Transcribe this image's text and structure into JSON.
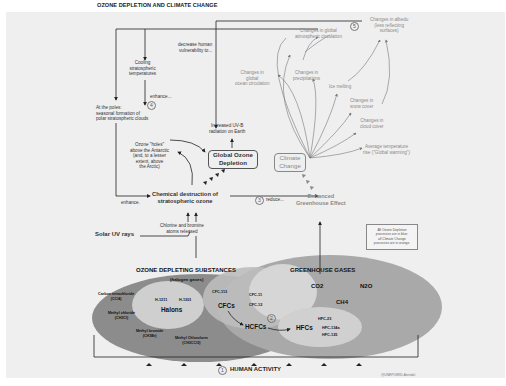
{
  "title": "OZONE DEPLETION AND CLIMATE CHANGE",
  "colors": {
    "panel_bg": "#efefef",
    "ozone_ellipse": "#8c8c8c",
    "greenhouse_ellipse": "#a9a9a9",
    "inner_circle": "#cfcfcf",
    "text_dark": "#333333",
    "text_light": "#8a8a8a"
  },
  "ozone_side": {
    "cooling": "Cooling\nstratospheric\ntemperatures",
    "enhance_4": "enhance...",
    "step_4": "4",
    "polar_clouds": "At the poles:\nseasonal formation of\npolar stratospheric clouds",
    "ozone_holes": "Ozone \"holes\"\nabove the Antarctic\n(and, to a lesser\nextent, above\nthe Arctic)",
    "decrease_vulnerability": "decrease human\nvulnerability to...",
    "uvb": "Increased UV-B\nradiation on Earth",
    "global_ozone_box": "Global Ozone\nDepletion",
    "enhance_left": "enhance.",
    "chemical_destruction": "Chemical destruction of\nstratospheric ozone",
    "chlorine_bromine": "Chlorine and bromine\natoms released",
    "solar_uv": "Solar UV rays"
  },
  "climate_side": {
    "step_5": "5",
    "atmospheric_circulation": "Changes in global\natmospheric circulation",
    "albedo": "Changes in albedu\n(less reflecting\nsurfaces)",
    "ocean_circulation": "Changes in\nglobal\nocean circulation",
    "precipitations": "Changes in\nprecipitations",
    "ice_melting": "Ice melting",
    "snow_cover": "Changes in\nsnow cover",
    "cloud_cover": "Changes in\ncloud cover",
    "avg_temp": "Average temperature\nrise (\"Global warming\")",
    "climate_box": "Climate\nChange",
    "step_3": "3",
    "reduce": "reduce...",
    "greenhouse_effect": "Enhanced\nGreenhouse Effect"
  },
  "legend": {
    "text": "All Ozone Depletion\nprocesses are in blue;\nall Climate Change\nprocesses are in orange."
  },
  "substances": {
    "ods_title": "OZONE DEPLETING SUBSTANCES",
    "ods_subtitle": "(halogen gases)",
    "carbon_tet": "Carbon tetrachloride\n(CCl4)",
    "methyl_chloride": "Methyl chloride\n(CH3Cl)",
    "methyl_bromide": "Methyl bromide\n(CH3Br)",
    "methyl_chloroform": "Methyl Chloroform\n(CH3CCl3)",
    "halons": "Halons",
    "h1211": "H-1211",
    "h1301": "H-1301",
    "cfcs": "CFCs",
    "cfc113": "CFC-113",
    "cfc11": "CFC-11",
    "cfc12": "CFC-12",
    "step_2": "2",
    "hcfcs": "HCFCs",
    "ghg_title": "GREENHOUSE GASES",
    "co2": "CO2",
    "n2o": "N2O",
    "ch4": "CH4",
    "hfcs": "HFCs",
    "hfc23": "HFC-23",
    "hfc134a": "HFC-134a",
    "hfc125": "HFC-125"
  },
  "footer": {
    "step_1": "1",
    "human_activity": "HUMAN ACTIVITY",
    "credit": "@UNEP/GRID-Arendal"
  }
}
